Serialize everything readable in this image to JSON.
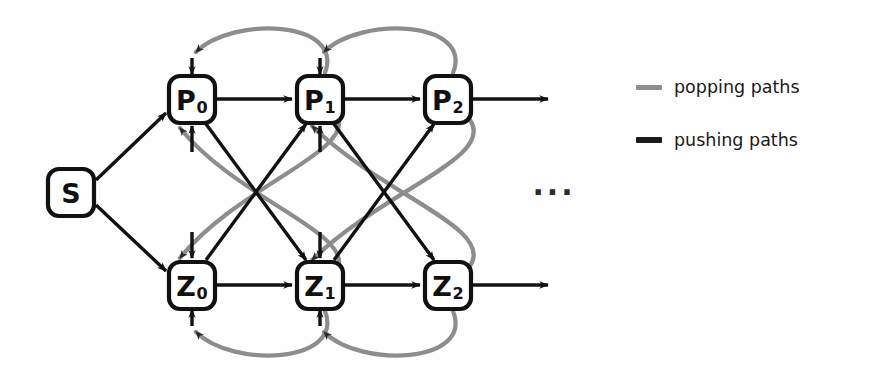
{
  "figure": {
    "background_color": "#fefefe",
    "ink_color": "#111111",
    "popping_color": "#8d8d8d",
    "pushing_color": "#111111"
  },
  "nodes": [
    {
      "id": "S",
      "base": "S",
      "sub": "",
      "cx": 71,
      "cy": 192
    },
    {
      "id": "P0",
      "base": "P",
      "sub": "0",
      "cx": 192,
      "cy": 99
    },
    {
      "id": "P1",
      "base": "P",
      "sub": "1",
      "cx": 320,
      "cy": 99
    },
    {
      "id": "P2",
      "base": "P",
      "sub": "2",
      "cx": 448,
      "cy": 99
    },
    {
      "id": "Z0",
      "base": "Z",
      "sub": "0",
      "cx": 192,
      "cy": 285
    },
    {
      "id": "Z1",
      "base": "Z",
      "sub": "1",
      "cx": 320,
      "cy": 285
    },
    {
      "id": "Z2",
      "base": "Z",
      "sub": "2",
      "cx": 448,
      "cy": 285
    }
  ],
  "edges": {
    "pushing": [
      {
        "from": "S",
        "to": "P0",
        "kind": "straight"
      },
      {
        "from": "S",
        "to": "Z0",
        "kind": "straight"
      },
      {
        "from": "P0",
        "to": "P1",
        "kind": "straight"
      },
      {
        "from": "P1",
        "to": "P2",
        "kind": "straight"
      },
      {
        "from": "P2",
        "to": "next",
        "kind": "straight"
      },
      {
        "from": "Z0",
        "to": "Z1",
        "kind": "straight"
      },
      {
        "from": "Z1",
        "to": "Z2",
        "kind": "straight"
      },
      {
        "from": "Z2",
        "to": "next",
        "kind": "straight"
      },
      {
        "from": "P0",
        "to": "Z1",
        "kind": "diagonal"
      },
      {
        "from": "Z0",
        "to": "P1",
        "kind": "diagonal"
      },
      {
        "from": "P1",
        "to": "Z2",
        "kind": "diagonal"
      },
      {
        "from": "Z1",
        "to": "P2",
        "kind": "diagonal"
      }
    ],
    "popping": [
      {
        "from": "P1",
        "to": "P0",
        "kind": "arc-top"
      },
      {
        "from": "P2",
        "to": "P1",
        "kind": "arc-top"
      },
      {
        "from": "Z1",
        "to": "Z0",
        "kind": "arc-bottom"
      },
      {
        "from": "Z2",
        "to": "Z1",
        "kind": "arc-bottom"
      },
      {
        "from": "Z1",
        "to": "P0",
        "kind": "curve-cross"
      },
      {
        "from": "P1",
        "to": "Z0",
        "kind": "curve-cross"
      },
      {
        "from": "Z2",
        "to": "P1",
        "kind": "curve-cross"
      },
      {
        "from": "P2",
        "to": "Z1",
        "kind": "curve-cross"
      }
    ]
  },
  "continuation": {
    "symbol": "···",
    "x": 554,
    "y": 193
  },
  "legend": {
    "items": [
      {
        "label": "popping paths",
        "color": "#8d8d8d",
        "x": 636,
        "y": 77
      },
      {
        "label": "pushing paths",
        "color": "#1a1a1a",
        "x": 636,
        "y": 130
      }
    ]
  }
}
